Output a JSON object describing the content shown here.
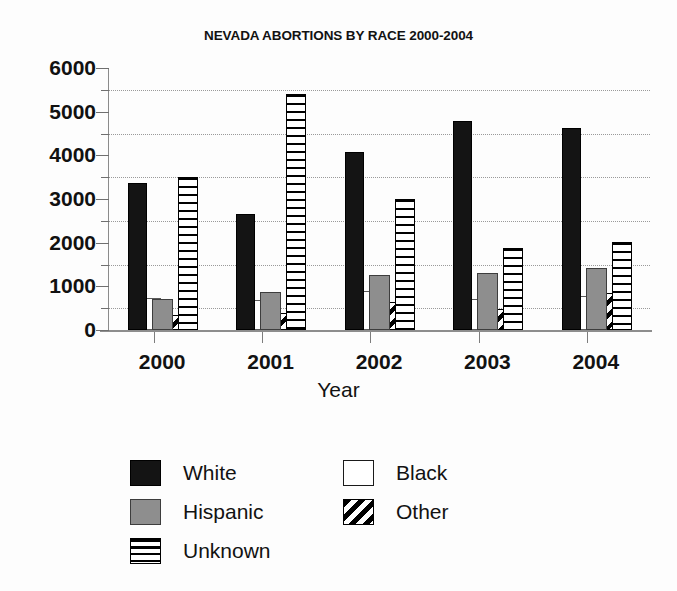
{
  "chart_data": {
    "type": "bar",
    "title": "NEVADA ABORTIONS BY RACE 2000-2004",
    "xlabel": "Year",
    "ylabel": "",
    "categories": [
      "2000",
      "2001",
      "2002",
      "2003",
      "2004"
    ],
    "series": [
      {
        "name": "White",
        "swatch": "solid-black",
        "values": [
          3370,
          2650,
          4070,
          4790,
          4620
        ]
      },
      {
        "name": "Black",
        "swatch": "empty-white",
        "values": [
          730,
          690,
          890,
          700,
          770
        ]
      },
      {
        "name": "Hispanic",
        "swatch": "solid-gray",
        "values": [
          700,
          870,
          1250,
          1310,
          1420
        ]
      },
      {
        "name": "Other",
        "swatch": "diagonal-hatch",
        "values": [
          350,
          400,
          640,
          490,
          850
        ]
      },
      {
        "name": "Unknown",
        "swatch": "horizontal-stripes",
        "values": [
          3500,
          5400,
          3000,
          1880,
          2020
        ]
      }
    ],
    "ylim": [
      0,
      6000
    ],
    "ytick_labels": [
      "0",
      "1000",
      "2000",
      "3000",
      "4000",
      "5000",
      "6000"
    ],
    "ytick_values": [
      0,
      1000,
      2000,
      3000,
      4000,
      5000,
      6000
    ],
    "yminor_values": [
      500,
      1500,
      2500,
      3500,
      4500,
      5500
    ],
    "grid": true,
    "grid_style": "dotted",
    "legend_position": "bottom",
    "legend_columns": [
      [
        "White",
        "Hispanic",
        "Unknown"
      ],
      [
        "Black",
        "Other"
      ]
    ],
    "colors": {
      "white_series": "#141414",
      "hispanic_series": "#8e8e8e",
      "black_series": "#ffffff",
      "hatch_ink": "#000000",
      "grid": "#9a9a9a",
      "axis": "#8b8b8b",
      "text": "#121212",
      "background": "#fdfdfd"
    }
  }
}
